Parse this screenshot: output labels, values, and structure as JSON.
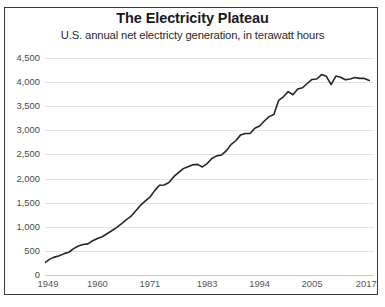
{
  "figure": {
    "clipped_text_above_frame": "",
    "background_color": "#ffffff",
    "frame_color": "#3a3a3a"
  },
  "chart_data": {
    "type": "line",
    "title": "The Electricity Plateau",
    "subtitle": "U.S. annual net electricty generation, in terawatt hours",
    "xlabel": "",
    "ylabel": "",
    "units": "terawatt hours",
    "grid": true,
    "legend": "none",
    "line_color": "#262626",
    "xlim": [
      1949,
      2018
    ],
    "ylim": [
      0,
      4500
    ],
    "ytick_labels": [
      "4,500",
      "4,000",
      "3,500",
      "3,000",
      "2,500",
      "2,000",
      "1,500",
      "1,000",
      "500",
      "0"
    ],
    "ytick_values": [
      4500,
      4000,
      3500,
      3000,
      2500,
      2000,
      1500,
      1000,
      500,
      0
    ],
    "xtick_labels": [
      "1949",
      "1960",
      "1971",
      "1983",
      "1994",
      "2005",
      "2017"
    ],
    "xtick_values": [
      1949,
      1960,
      1971,
      1983,
      1994,
      2005,
      2017
    ],
    "x": [
      1949,
      1950,
      1951,
      1952,
      1953,
      1954,
      1955,
      1956,
      1957,
      1958,
      1959,
      1960,
      1961,
      1962,
      1963,
      1964,
      1965,
      1966,
      1967,
      1968,
      1969,
      1970,
      1971,
      1972,
      1973,
      1974,
      1975,
      1976,
      1977,
      1978,
      1979,
      1980,
      1981,
      1982,
      1983,
      1984,
      1985,
      1986,
      1987,
      1988,
      1989,
      1990,
      1991,
      1992,
      1993,
      1994,
      1995,
      1996,
      1997,
      1998,
      1999,
      2000,
      2001,
      2002,
      2003,
      2004,
      2005,
      2006,
      2007,
      2008,
      2009,
      2010,
      2011,
      2012,
      2013,
      2014,
      2015,
      2016,
      2017
    ],
    "values": [
      255,
      329,
      371,
      399,
      443,
      472,
      547,
      601,
      632,
      645,
      710,
      756,
      794,
      855,
      917,
      984,
      1058,
      1145,
      1214,
      1329,
      1442,
      1532,
      1613,
      1750,
      1861,
      1867,
      1918,
      2038,
      2124,
      2206,
      2247,
      2286,
      2295,
      2241,
      2310,
      2416,
      2470,
      2487,
      2572,
      2704,
      2784,
      2901,
      2934,
      2934,
      3044,
      3089,
      3194,
      3284,
      3329,
      3620,
      3695,
      3802,
      3737,
      3858,
      3883,
      3971,
      4055,
      4065,
      4157,
      4119,
      3950,
      4125,
      4100,
      4048,
      4066,
      4094,
      4078,
      4077,
      4034
    ],
    "series_name": "U.S. annual net electricity generation"
  }
}
